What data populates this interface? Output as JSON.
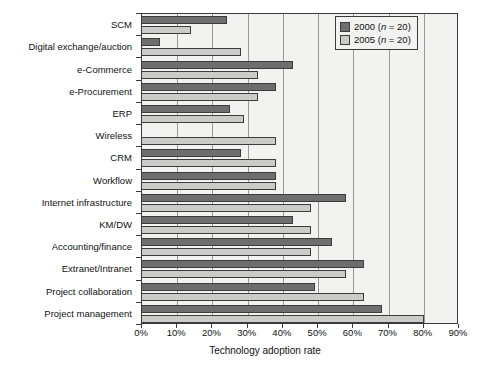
{
  "chart_data": {
    "type": "bar",
    "orientation": "horizontal",
    "title": "",
    "xlabel": "Technology adoption rate",
    "ylabel": "",
    "xlim": [
      0,
      90
    ],
    "xtick_values": [
      0,
      10,
      20,
      30,
      40,
      50,
      60,
      70,
      80,
      90
    ],
    "xtick_labels": [
      "0%",
      "10%",
      "20%",
      "30%",
      "40%",
      "50%",
      "60%",
      "70%",
      "80%",
      "90%"
    ],
    "grid": "vertical",
    "legend_position": "top-right",
    "categories": [
      "SCM",
      "Digital exchange/auction",
      "e-Commerce",
      "e-Procurement",
      "ERP",
      "Wireless",
      "CRM",
      "Workflow",
      "Internet infrastructure",
      "KM/DW",
      "Accounting/finance",
      "Extranet/Intranet",
      "Project collaboration",
      "Project management"
    ],
    "series": [
      {
        "name": "2000 (n = 20)",
        "label_year": "2000",
        "label_n": "n = 20",
        "color": "#6e6e6e",
        "values": [
          24,
          5,
          43,
          38,
          25,
          0,
          28,
          38,
          58,
          43,
          54,
          63,
          49,
          68
        ]
      },
      {
        "name": "2005 (n = 20)",
        "label_year": "2005",
        "label_n": "n = 20",
        "color": "#cbcbc9",
        "values": [
          14,
          28,
          33,
          33,
          29,
          38,
          38,
          38,
          48,
          48,
          48,
          58,
          63,
          80
        ]
      }
    ]
  },
  "legend": {
    "items": [
      {
        "year": "2000",
        "n_prefix": "(",
        "n_var": "n",
        "n_rest": " = 20)"
      },
      {
        "year": "2005",
        "n_prefix": "(",
        "n_var": "n",
        "n_rest": " = 20)"
      }
    ]
  },
  "axis": {
    "x_title": "Technology adoption rate"
  }
}
